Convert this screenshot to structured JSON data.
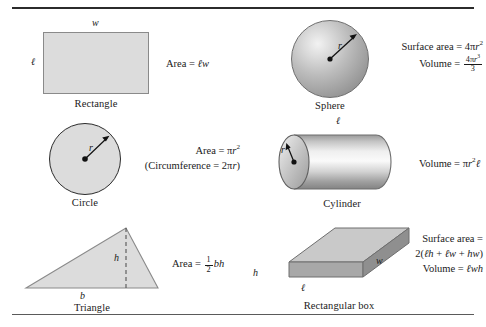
{
  "page": {
    "rule_top": true,
    "rule_bottom": true
  },
  "colors": {
    "shape_fill_2d": "#dcdcdc",
    "shape_stroke_2d": "#8a8a8a",
    "circle_stroke": "#2b2b2b",
    "sphere_light": "#f2f2f2",
    "sphere_dark": "#8d8d8d",
    "box_top": "#c9c9c9",
    "box_front": "#a8a8a8",
    "box_side": "#8f8f8f",
    "rule": "#2b2b2b",
    "text": "#1a1a1a"
  },
  "figures": [
    {
      "id": "rectangle",
      "caption": "Rectangle",
      "labels": {
        "top": "w",
        "left": "ℓ"
      },
      "formula_lines": [
        "Area = ℓw"
      ]
    },
    {
      "id": "sphere",
      "caption": "Sphere",
      "labels": {
        "radius": "r"
      },
      "formula_lines": [
        "Surface area = 4πr²",
        "Volume = 4πr³ / 3"
      ]
    },
    {
      "id": "circle",
      "caption": "Circle",
      "labels": {
        "radius": "r"
      },
      "formula_lines": [
        "Area = πr²",
        "(Circumference = 2πr)"
      ]
    },
    {
      "id": "cylinder",
      "caption": "Cylinder",
      "labels": {
        "length": "ℓ",
        "radius": "r"
      },
      "formula_lines": [
        "Volume = πr²ℓ"
      ]
    },
    {
      "id": "triangle",
      "caption": "Triangle",
      "labels": {
        "height": "h",
        "base": "b"
      },
      "formula_lines": [
        "Area = ½bh"
      ]
    },
    {
      "id": "rectangular-box",
      "caption": "Rectangular box",
      "labels": {
        "height": "h",
        "length": "ℓ",
        "width": "w"
      },
      "formula_lines": [
        "Surface area =",
        "2(ℓh + ℓw + hw)",
        "Volume = ℓwh"
      ]
    }
  ],
  "text": {
    "area": "Area",
    "surface_area": "Surface area",
    "volume": "Volume",
    "circumference": "Circumference",
    "equals": "=",
    "pi": "π",
    "var_w": "w",
    "var_l": "ℓ",
    "var_r": "r",
    "var_h": "h",
    "var_b": "b",
    "num_4": "4",
    "num_2": "2",
    "num_3": "3",
    "num_1": "1",
    "exp_2": "2",
    "exp_3": "3",
    "open_paren": "(",
    "close_paren": ")",
    "plus": "+",
    "captions": {
      "rectangle": "Rectangle",
      "sphere": "Sphere",
      "circle": "Circle",
      "cylinder": "Cylinder",
      "triangle": "Triangle",
      "box": "Rectangular box"
    }
  }
}
